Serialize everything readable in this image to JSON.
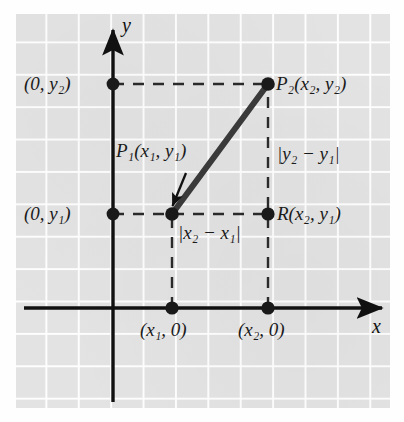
{
  "figure": {
    "kind": "coordinate-plane-distance-diagram",
    "background_color": "#e3e3e3",
    "ink_color": "#1a1a1a",
    "axes": {
      "x_label": "x",
      "y_label": "y",
      "x_axis_name": "x-axis",
      "y_axis_name": "y-axis"
    },
    "labels": {
      "p1": "P₁(x₁, y₁)",
      "p2": "P₂(x₂, y₂)",
      "r": "R(x₂, y₁)",
      "y2_intercept": "(0, y₂)",
      "y1_intercept": "(0, y₁)",
      "x1_intercept": "(x₁, 0)",
      "x2_intercept": "(x₂, 0)",
      "vertical_distance": "|y₂ − y₁|",
      "horizontal_distance": "|x₂ − x₁|"
    },
    "points": [
      {
        "name": "P1",
        "label": "P₁(x₁, y₁)",
        "x": 172,
        "y": 214
      },
      {
        "name": "P2",
        "label": "P₂(x₂, y₂)",
        "x": 268,
        "y": 84
      },
      {
        "name": "R",
        "label": "R(x₂, y₁)",
        "x": 268,
        "y": 214
      },
      {
        "name": "y2-on-axis",
        "label": "(0, y₂)",
        "x": 113,
        "y": 84
      },
      {
        "name": "y1-on-axis",
        "label": "(0, y₁)",
        "x": 113,
        "y": 214
      },
      {
        "name": "x1-on-axis",
        "label": "(x₁, 0)",
        "x": 172,
        "y": 308
      },
      {
        "name": "x2-on-axis",
        "label": "(x₂, 0)",
        "x": 268,
        "y": 308
      }
    ],
    "segments": [
      {
        "name": "hypotenuse",
        "from": "P1",
        "to": "P2",
        "style": "solid-thick"
      },
      {
        "name": "leg-horizontal",
        "from": "P1",
        "to": "R",
        "style": "dashed"
      },
      {
        "name": "leg-vertical",
        "from": "R",
        "to": "P2",
        "style": "dashed"
      },
      {
        "name": "guide-y2",
        "from": "y2-on-axis",
        "to": "P2",
        "style": "dashed"
      },
      {
        "name": "guide-y1",
        "from": "y1-on-axis",
        "to": "P1",
        "style": "dashed"
      },
      {
        "name": "guide-x1",
        "from": "x1-on-axis",
        "to": "P1",
        "style": "dashed"
      },
      {
        "name": "guide-x2",
        "from": "x2-on-axis",
        "to": "R",
        "style": "dashed"
      }
    ],
    "annotation_arrow": {
      "name": "p1-callout-arrow",
      "from_x": 185,
      "from_y": 176,
      "to_x": 171,
      "to_y": 208
    }
  }
}
